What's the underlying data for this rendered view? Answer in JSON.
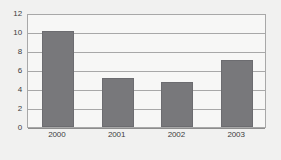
{
  "chart_data": {
    "type": "bar",
    "title": "",
    "subtitle": "",
    "xlabel": "",
    "ylabel": "",
    "categories": [
      "2000",
      "2001",
      "2002",
      "2003"
    ],
    "values": [
      10.1,
      5.2,
      4.7,
      7.1
    ],
    "series": [
      {
        "name": "",
        "values": [
          10.1,
          5.2,
          4.7,
          7.1
        ]
      }
    ],
    "ylim": [
      0,
      12
    ],
    "yticks": [
      0,
      2,
      4,
      6,
      8,
      10,
      12
    ],
    "ytick_labels": [
      "0",
      "2",
      "4",
      "6",
      "8",
      "10",
      "12"
    ],
    "grid": "horizontal",
    "legend": "none",
    "annotations": [],
    "colors": {
      "bar_fill": "#78787b",
      "bar_stroke": "#6c6c70",
      "gridline": "#a8a8a8",
      "axis": "#8d8d8d",
      "plot_background": "#f7f7f6",
      "page_background": "#f1f1f0",
      "tick_label": "#3d3d3d"
    }
  }
}
